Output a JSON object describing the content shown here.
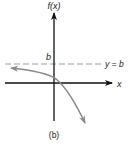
{
  "figure": {
    "y_axis_label": "f(x)",
    "x_axis_label": "x",
    "asymptote_value_label": "b",
    "asymptote_equation": "y = b",
    "caption": "(b)"
  },
  "colors": {
    "axis": "#111111",
    "curve": "#8a8a8a",
    "asymptote": "#a0a0a0",
    "text": "#222222"
  }
}
